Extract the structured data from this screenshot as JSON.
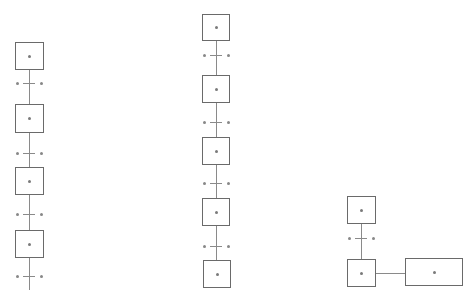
{
  "diagram": {
    "type": "sfc-grafcet",
    "colors": {
      "stroke": "#6a6a6a",
      "line": "#8a8a8a",
      "dot": "#7a7a7a",
      "background": "#ffffff"
    },
    "columns": [
      {
        "id": "col-1",
        "center_x": 29,
        "steps": [
          {
            "x": 15,
            "y": 42,
            "w": 29,
            "h": 28,
            "label": "*"
          },
          {
            "x": 15,
            "y": 104,
            "w": 29,
            "h": 29,
            "label": "*"
          },
          {
            "x": 15,
            "y": 167,
            "w": 29,
            "h": 28,
            "label": "*"
          },
          {
            "x": 15,
            "y": 230,
            "w": 29,
            "h": 28,
            "label": "*"
          }
        ],
        "transitions": [
          {
            "y": 83,
            "left_label": "*",
            "right_label": "*"
          },
          {
            "y": 153,
            "left_label": "*",
            "right_label": "*"
          },
          {
            "y": 214,
            "left_label": "*",
            "right_label": "*"
          },
          {
            "y": 276,
            "left_label": "*",
            "right_label": "*"
          }
        ],
        "line_top": 70,
        "line_bottom": 290
      },
      {
        "id": "col-2",
        "center_x": 216,
        "steps": [
          {
            "x": 202,
            "y": 14,
            "w": 28,
            "h": 27,
            "label": "*"
          },
          {
            "x": 202,
            "y": 75,
            "w": 28,
            "h": 28,
            "label": "*"
          },
          {
            "x": 202,
            "y": 137,
            "w": 28,
            "h": 28,
            "label": "*"
          },
          {
            "x": 202,
            "y": 198,
            "w": 28,
            "h": 28,
            "label": "*"
          },
          {
            "x": 203,
            "y": 260,
            "w": 28,
            "h": 28,
            "label": "*"
          }
        ],
        "transitions": [
          {
            "y": 55,
            "left_label": "*",
            "right_label": "*"
          },
          {
            "y": 122,
            "left_label": "*",
            "right_label": "*"
          },
          {
            "y": 183,
            "left_label": "*",
            "right_label": "*"
          },
          {
            "y": 246,
            "left_label": "*",
            "right_label": "*"
          }
        ],
        "line_top": 41,
        "line_bottom": 260
      },
      {
        "id": "col-3",
        "center_x": 361,
        "steps": [
          {
            "x": 347,
            "y": 196,
            "w": 29,
            "h": 28,
            "label": "*"
          },
          {
            "x": 347,
            "y": 259,
            "w": 29,
            "h": 28,
            "label": "*"
          }
        ],
        "transitions": [
          {
            "y": 238,
            "left_label": "*",
            "right_label": "*"
          }
        ],
        "line_top": 224,
        "line_bottom": 259,
        "action": {
          "x": 405,
          "y": 258,
          "w": 58,
          "h": 28,
          "label": "*",
          "connector_y": 273
        }
      }
    ]
  }
}
